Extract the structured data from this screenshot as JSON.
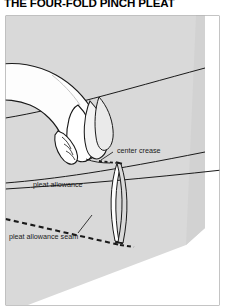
{
  "page": {
    "title": "THE FOUR-FOLD PINCH PLEAT",
    "background_color": "#ffffff"
  },
  "figure": {
    "name": "pinch-pleat-illustration",
    "fabric_color": "#d9d9d9",
    "hand_color": "#fdfdfd",
    "line_color": "#1a1a1a",
    "frame_color": "#8a8a8a",
    "labels": [
      {
        "id": "center-crease",
        "text": "center crease"
      },
      {
        "id": "pleat-allowance",
        "text": "pleat allowance"
      },
      {
        "id": "pleat-allowance-seam",
        "text": "pleat allowance seam"
      }
    ]
  }
}
